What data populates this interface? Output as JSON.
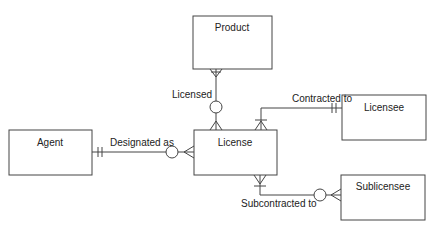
{
  "diagram": {
    "type": "entity-relationship",
    "entities": [
      {
        "id": "product",
        "label": "Product"
      },
      {
        "id": "agent",
        "label": "Agent"
      },
      {
        "id": "license",
        "label": "License"
      },
      {
        "id": "licensee",
        "label": "Licensee"
      },
      {
        "id": "sublicensee",
        "label": "Sublicensee"
      }
    ],
    "relationships": [
      {
        "id": "licensed",
        "label": "Licensed",
        "from": "product",
        "to": "license",
        "from_cardinality": "one-and-only-one",
        "to_cardinality": "zero-or-many"
      },
      {
        "id": "contracted",
        "label": "Contracted to",
        "from": "licensee",
        "to": "license",
        "from_cardinality": "one-and-only-one",
        "to_cardinality": "one-or-many"
      },
      {
        "id": "designated",
        "label": "Designated as",
        "from": "agent",
        "to": "license",
        "from_cardinality": "one-and-only-one",
        "to_cardinality": "zero-or-many"
      },
      {
        "id": "subcontracted",
        "label": "Subcontracted to",
        "from": "license",
        "to": "sublicensee",
        "from_cardinality": "one-or-many",
        "to_cardinality": "zero-or-many"
      }
    ]
  },
  "colors": {
    "line": "#444444",
    "text": "#222222",
    "background": "#ffffff"
  }
}
